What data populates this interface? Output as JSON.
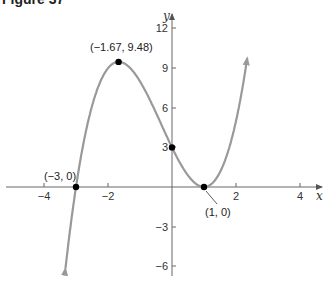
{
  "title": "Figure 37",
  "chart_data": {
    "type": "line",
    "title": "Figure 37",
    "function": "f(x) = (x + 3)(x - 1)^2 = x^3 + x^2 - 5x + 3",
    "xlabel": "x",
    "ylabel": "y",
    "xlim": [
      -5.3,
      5.0
    ],
    "ylim": [
      -6.5,
      13.5
    ],
    "x_ticks": [
      -4,
      -2,
      2,
      4
    ],
    "x_tick_labels": [
      "−4",
      "−2",
      "2",
      "4"
    ],
    "y_ticks": [
      12,
      9,
      6,
      3,
      -3,
      -6
    ],
    "y_tick_labels": [
      "12",
      "9",
      "6",
      "3",
      "−3",
      "−6"
    ],
    "grid": false,
    "curve_color": "#999999",
    "series": [
      {
        "name": "f(x)",
        "x": [
          -3.4,
          -3.0,
          -2.5,
          -2.0,
          -1.67,
          -1.0,
          -0.5,
          0.0,
          0.5,
          1.0,
          1.5,
          2.0,
          2.35
        ],
        "y": [
          -7.8,
          0.0,
          5.63,
          9.0,
          9.48,
          8.0,
          5.63,
          3.0,
          0.88,
          0.0,
          1.13,
          5.0,
          9.6
        ]
      }
    ],
    "labeled_points": [
      {
        "x": -3,
        "y": 0,
        "label": "(−3, 0)"
      },
      {
        "x": -1.67,
        "y": 9.48,
        "label": "(−1.67, 9.48)"
      },
      {
        "x": 0,
        "y": 3,
        "label": ""
      },
      {
        "x": 1,
        "y": 0,
        "label": "(1, 0)"
      }
    ]
  },
  "labels": {
    "x_axis": "x",
    "y_axis": "y",
    "pt_neg3": "(−3, 0)",
    "pt_max": "(−1.67, 9.48)",
    "pt_one": "(1, 0)",
    "xt_m4": "−4",
    "xt_m2": "−2",
    "xt_2": "2",
    "xt_4": "4",
    "yt_12": "12",
    "yt_9": "9",
    "yt_6": "6",
    "yt_3": "3",
    "yt_m3": "−3",
    "yt_m6": "−6"
  }
}
